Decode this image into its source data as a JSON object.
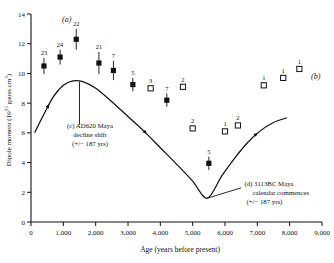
{
  "chart_data": {
    "type": "scatter",
    "title": "",
    "panel_label": "(a)",
    "curve_label": "(b)",
    "xlabel": "Age (years before present)",
    "ylabel": "Dipole moment (10²⁵ gauss cm³)",
    "xlim": [
      0,
      9000
    ],
    "ylim": [
      0,
      14
    ],
    "xticks": [
      0,
      1000,
      2000,
      3000,
      4000,
      5000,
      6000,
      7000,
      8000,
      9000
    ],
    "xticklabels": [
      "0",
      "1,000",
      "2,000",
      "3,000",
      "4,000",
      "5,000",
      "6,000",
      "7,000",
      "8,000",
      "9,000"
    ],
    "yticks": [
      0,
      2,
      4,
      6,
      8,
      10,
      12,
      14
    ],
    "yticklabels": [
      "0",
      "2",
      "4",
      "6",
      "8",
      "10",
      "12",
      "14"
    ],
    "grid": false,
    "legend": "none",
    "series": [
      {
        "name": "filled-squares",
        "marker": "filled-square",
        "points": [
          {
            "x": 400,
            "y": 10.5,
            "err": 0.55,
            "label": "23"
          },
          {
            "x": 900,
            "y": 11.1,
            "err": 0.5,
            "label": "24"
          },
          {
            "x": 1400,
            "y": 12.3,
            "err": 0.7,
            "label": "22"
          },
          {
            "x": 2100,
            "y": 10.7,
            "err": 0.75,
            "label": "21"
          },
          {
            "x": 2550,
            "y": 10.2,
            "err": 0.65,
            "label": "7"
          },
          {
            "x": 3150,
            "y": 9.25,
            "err": 0.45,
            "label": "5"
          },
          {
            "x": 4200,
            "y": 8.2,
            "err": 0.45,
            "label": "7"
          },
          {
            "x": 5500,
            "y": 3.95,
            "err": 0.45,
            "label": "5"
          }
        ]
      },
      {
        "name": "open-squares",
        "marker": "open-square",
        "points": [
          {
            "x": 3700,
            "y": 9.0,
            "err": 0,
            "label": "3"
          },
          {
            "x": 4700,
            "y": 9.1,
            "err": 0,
            "label": "2"
          },
          {
            "x": 5000,
            "y": 6.3,
            "err": 0,
            "label": "2"
          },
          {
            "x": 6000,
            "y": 6.1,
            "err": 0,
            "label": "1"
          },
          {
            "x": 6400,
            "y": 6.5,
            "err": 0,
            "label": "2"
          },
          {
            "x": 7200,
            "y": 9.2,
            "err": 0,
            "label": "1"
          },
          {
            "x": 7800,
            "y": 9.7,
            "err": 0,
            "label": "1"
          },
          {
            "x": 8300,
            "y": 10.3,
            "err": 0,
            "label": "1"
          }
        ]
      }
    ],
    "curve": {
      "name": "dipole-moment-model-curve",
      "points": [
        {
          "x": 120,
          "y": 6.05
        },
        {
          "x": 400,
          "y": 7.25
        },
        {
          "x": 700,
          "y": 8.45
        },
        {
          "x": 1000,
          "y": 9.2
        },
        {
          "x": 1300,
          "y": 9.5
        },
        {
          "x": 1600,
          "y": 9.45
        },
        {
          "x": 2000,
          "y": 9.0
        },
        {
          "x": 2500,
          "y": 8.1
        },
        {
          "x": 3000,
          "y": 7.1
        },
        {
          "x": 3500,
          "y": 6.1
        },
        {
          "x": 4000,
          "y": 5.0
        },
        {
          "x": 4500,
          "y": 3.9
        },
        {
          "x": 5000,
          "y": 2.75
        },
        {
          "x": 5450,
          "y": 1.6
        },
        {
          "x": 5900,
          "y": 3.1
        },
        {
          "x": 6300,
          "y": 4.3
        },
        {
          "x": 6700,
          "y": 5.35
        },
        {
          "x": 7100,
          "y": 6.15
        },
        {
          "x": 7500,
          "y": 6.7
        },
        {
          "x": 7900,
          "y": 7.0
        }
      ],
      "flow_arrows": [
        {
          "x": 560,
          "y": 7.95
        },
        {
          "x": 3600,
          "y": 5.9
        },
        {
          "x": 7000,
          "y": 6.05
        }
      ]
    },
    "annotations": [
      {
        "id": "c",
        "lines": [
          "(c) AD620 Maya",
          "decline shift",
          "(+/− 187 yrs)"
        ],
        "leader_x": 1500,
        "leader_y_top": 9.45,
        "leader_y_bottom": 6.55
      },
      {
        "id": "d",
        "lines": [
          "(d) 3113BC Maya",
          "calendar commences",
          "(+/− 187 yrs)"
        ],
        "leader_from_x": 5450,
        "leader_from_y": 1.6,
        "leader_to_x": 6500,
        "leader_to_y": 2.3
      }
    ]
  }
}
